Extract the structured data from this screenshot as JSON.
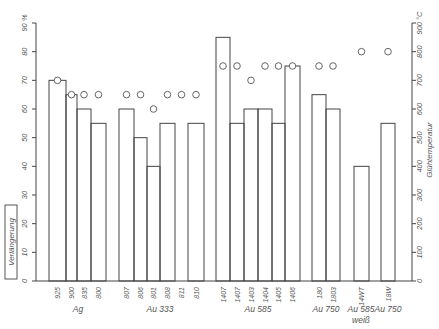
{
  "chart_data": {
    "type": "bar",
    "title": "",
    "ylabel": "Verlängerung",
    "ylabel_unit": "%",
    "y2label": "Glühtemperatur",
    "y2label_unit": "°C",
    "ylim": [
      0,
      90
    ],
    "y2lim": [
      0,
      900
    ],
    "yticks": [
      0,
      10,
      20,
      30,
      40,
      50,
      60,
      70,
      80,
      90
    ],
    "y2ticks": [
      0,
      100,
      200,
      300,
      400,
      500,
      600,
      700,
      800,
      900
    ],
    "grid": false,
    "legend": null,
    "categories": [
      "925",
      "900",
      "835",
      "800",
      "807",
      "806",
      "801",
      "808",
      "811",
      "810",
      "1407",
      "1407",
      "1403",
      "1404",
      "1405",
      "1406",
      "180",
      "1803",
      "14WT",
      "18W"
    ],
    "groups": [
      {
        "label": "Ag",
        "categories": [
          "925",
          "900",
          "835",
          "800"
        ]
      },
      {
        "label": "Au 333",
        "categories": [
          "807",
          "806",
          "801",
          "808",
          "811",
          "810"
        ]
      },
      {
        "label": "Au 585",
        "categories": [
          "1407",
          "1407",
          "1403",
          "1404",
          "1405",
          "1406"
        ]
      },
      {
        "label": "Au 750",
        "categories": [
          "180",
          "1803"
        ]
      },
      {
        "label": "Au 585",
        "sublabel": "weiß",
        "categories": [
          "14WT"
        ]
      },
      {
        "label": "Au 750",
        "categories": [
          "18W"
        ]
      }
    ],
    "series": [
      {
        "name": "Verlängerung (%)",
        "kind": "bar",
        "axis": "left",
        "values": [
          70,
          65,
          60,
          55,
          60,
          50,
          40,
          55,
          null,
          55,
          85,
          55,
          60,
          60,
          55,
          75,
          65,
          60,
          40,
          55
        ]
      },
      {
        "name": "Glühtemperatur (°C)",
        "kind": "scatter",
        "marker": "open-circle",
        "axis": "right",
        "values": [
          700,
          650,
          650,
          650,
          650,
          650,
          600,
          650,
          650,
          650,
          750,
          750,
          700,
          750,
          750,
          750,
          750,
          750,
          800,
          800
        ]
      }
    ]
  },
  "labels": {
    "y_left_top": "90 %",
    "y_right_top": "900 °C",
    "y_left_title": "Verlängerung",
    "y_right_title": "Glühtemperatur"
  }
}
